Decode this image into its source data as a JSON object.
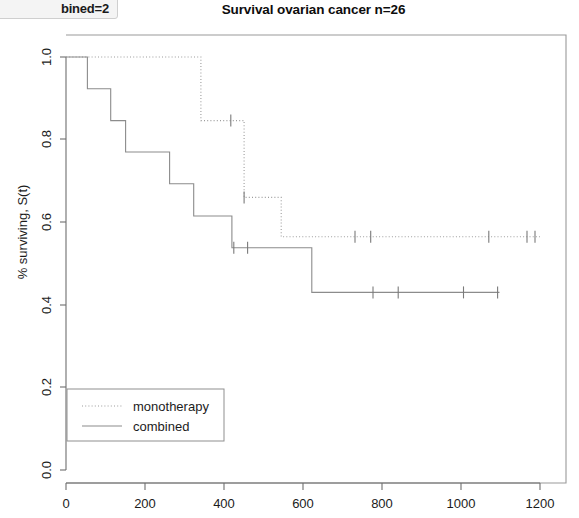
{
  "ui_chip": {
    "label": "bined=2",
    "full_text": "combined=2"
  },
  "chart_data": {
    "type": "line",
    "subtype": "kaplan-meier-survival",
    "title": "Survival ovarian cancer n=26",
    "xlabel": "",
    "ylabel": "% surviving, S(t)",
    "xlim": [
      0,
      1240
    ],
    "ylim": [
      0.0,
      1.0
    ],
    "xticks": [
      0,
      200,
      400,
      600,
      800,
      1000,
      1200
    ],
    "xtick_labels": [
      "0",
      "200",
      "400",
      "600",
      "800",
      "1000",
      "1200"
    ],
    "yticks": [
      0.0,
      0.2,
      0.4,
      0.6,
      0.8,
      1.0
    ],
    "ytick_labels": [
      "0.0",
      "0.2",
      "0.4",
      "0.6",
      "0.8",
      "1.0"
    ],
    "grid": false,
    "legend_position": "bottom-left",
    "series": [
      {
        "name": "monotherapy",
        "style": "dotted",
        "color": "#9c9c9c",
        "steps": [
          {
            "t": 0,
            "s": 1.0
          },
          {
            "t": 353,
            "s": 1.0
          },
          {
            "t": 353,
            "s": 0.846
          },
          {
            "t": 466,
            "s": 0.846
          },
          {
            "t": 466,
            "s": 0.66
          },
          {
            "t": 563,
            "s": 0.66
          },
          {
            "t": 563,
            "s": 0.565
          },
          {
            "t": 1240,
            "s": 0.565
          }
        ],
        "censored_times": [
          431,
          466,
          756,
          797,
          1106,
          1206,
          1227
        ]
      },
      {
        "name": "combined",
        "style": "solid",
        "color": "#8c8c8c",
        "steps": [
          {
            "t": 0,
            "s": 1.0
          },
          {
            "t": 56,
            "s": 1.0
          },
          {
            "t": 56,
            "s": 0.923
          },
          {
            "t": 117,
            "s": 0.923
          },
          {
            "t": 117,
            "s": 0.846
          },
          {
            "t": 156,
            "s": 0.846
          },
          {
            "t": 156,
            "s": 0.77
          },
          {
            "t": 271,
            "s": 0.77
          },
          {
            "t": 271,
            "s": 0.693
          },
          {
            "t": 334,
            "s": 0.693
          },
          {
            "t": 334,
            "s": 0.615
          },
          {
            "t": 434,
            "s": 0.615
          },
          {
            "t": 434,
            "s": 0.538
          },
          {
            "t": 643,
            "s": 0.538
          },
          {
            "t": 643,
            "s": 0.43
          },
          {
            "t": 1134,
            "s": 0.43
          }
        ],
        "censored_times": [
          439,
          475,
          803,
          869,
          1040,
          1129
        ]
      }
    ]
  },
  "legend": {
    "entries": [
      {
        "label": "monotherapy",
        "style": "dotted"
      },
      {
        "label": "combined",
        "style": "solid"
      }
    ]
  }
}
